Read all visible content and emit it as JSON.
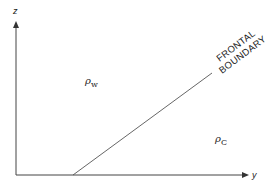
{
  "diagram": {
    "axes": {
      "vertical_label": "z",
      "horizontal_label": "y"
    },
    "regions": {
      "warm": {
        "symbol": "ρ",
        "subscript": "w"
      },
      "cold": {
        "symbol": "ρ",
        "subscript": "C"
      }
    },
    "boundary": {
      "line1": "FRONTAL",
      "line2": "BOUNDARY"
    },
    "colors": {
      "ink": "#333333",
      "background": "#ffffff"
    }
  }
}
